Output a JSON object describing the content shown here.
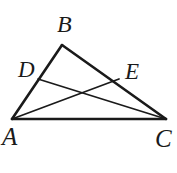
{
  "figure": {
    "kind": "geometry-diagram",
    "shape": "triangle-with-two-cevians",
    "background_color": "#ffffff",
    "stroke_color": "#1a1a1a",
    "label_color": "#1a1a1a",
    "canvas": {
      "width": 177,
      "height": 173
    },
    "points": {
      "A": {
        "label": "A",
        "x": 12,
        "y": 119
      },
      "B": {
        "label": "B",
        "x": 62,
        "y": 45
      },
      "C": {
        "label": "C",
        "x": 166,
        "y": 119
      },
      "D": {
        "label": "D",
        "x": 38,
        "y": 79
      },
      "E": {
        "label": "E",
        "x": 119,
        "y": 79
      },
      "X": {
        "label": "",
        "x": 82,
        "y": 92
      }
    },
    "segments": [
      {
        "name": "side-AB",
        "from": "A",
        "to": "B",
        "width": 2.6
      },
      {
        "name": "side-BC",
        "from": "B",
        "to": "C",
        "width": 2.6
      },
      {
        "name": "side-CA",
        "from": "C",
        "to": "A",
        "width": 2.6
      },
      {
        "name": "cevian-DC",
        "from": "D",
        "to": "C",
        "width": 1.7
      },
      {
        "name": "cevian-AE",
        "from": "A",
        "to": "E",
        "width": 1.7
      }
    ],
    "labels": {
      "B": "B",
      "D": "D",
      "E": "E",
      "A": "A",
      "C": "C"
    }
  }
}
